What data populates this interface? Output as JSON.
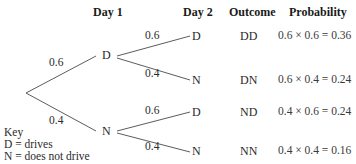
{
  "headers": {
    "day1": "Day 1",
    "day2": "Day 2",
    "outcome": "Outcome",
    "probability": "Probability"
  },
  "tree": {
    "root_branches": [
      {
        "prob": "0.6",
        "node": "D"
      },
      {
        "prob": "0.4",
        "node": "N"
      }
    ],
    "day2_branches": [
      {
        "prob": "0.6",
        "node": "D",
        "outcome": "DD",
        "calc": "0.6 × 0.6 = 0.36"
      },
      {
        "prob": "0.4",
        "node": "N",
        "outcome": "DN",
        "calc": "0.6 × 0.4 = 0.24"
      },
      {
        "prob": "0.6",
        "node": "D",
        "outcome": "ND",
        "calc": "0.4 × 0.6 = 0.24"
      },
      {
        "prob": "0.4",
        "node": "N",
        "outcome": "NN",
        "calc": "0.4 × 0.4 = 0.16"
      }
    ]
  },
  "key": {
    "title": "Key",
    "d": "D = drives",
    "n": "N = does not drive"
  },
  "colors": {
    "line": "#4a4a4a",
    "text": "#2a2a2a"
  }
}
